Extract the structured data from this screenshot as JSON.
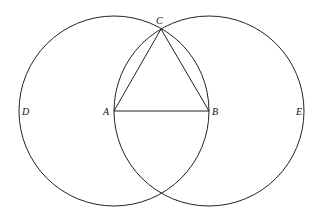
{
  "diagram": {
    "type": "geometric-construction",
    "colors": {
      "stroke": "#222222",
      "background": "#ffffff"
    },
    "points": {
      "A": {
        "label": "A",
        "x": 114,
        "y": 111
      },
      "B": {
        "label": "B",
        "x": 209,
        "y": 111
      },
      "C": {
        "label": "C",
        "x": 160,
        "y": 30
      },
      "D": {
        "label": "D",
        "x": 19,
        "y": 111
      },
      "E": {
        "label": "E",
        "x": 304,
        "y": 111
      }
    },
    "circles": [
      {
        "name": "circle-A",
        "center": "A",
        "radius": 95
      },
      {
        "name": "circle-B",
        "center": "B",
        "radius": 95
      }
    ],
    "segments": [
      {
        "name": "AB",
        "from": "A",
        "to": "B"
      },
      {
        "name": "AC",
        "from": "A",
        "to": "C"
      },
      {
        "name": "BC",
        "from": "B",
        "to": "C"
      }
    ]
  }
}
